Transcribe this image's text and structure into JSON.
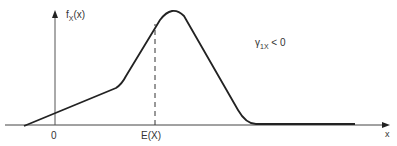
{
  "diagram": {
    "type": "probability-density-sketch",
    "y_axis_label": {
      "main": "f",
      "sub": "X",
      "rest": "(x)"
    },
    "x_axis_label": "x",
    "tick_labels": {
      "zero": "0",
      "mean": "E(X)"
    },
    "annotation": {
      "symbol": "γ",
      "sub": "1X",
      "rest": " < 0"
    },
    "colors": {
      "line": "#222222",
      "axis": "#444444",
      "text": "#333333",
      "background": "#ffffff"
    }
  }
}
